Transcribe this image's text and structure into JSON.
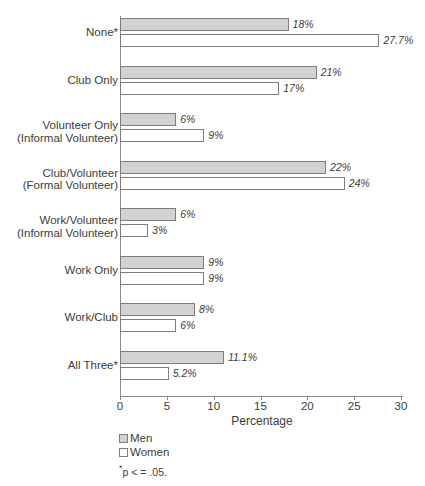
{
  "chart_data": {
    "type": "bar",
    "orientation": "horizontal",
    "title": "",
    "xlabel": "Percentage",
    "ylabel": "",
    "xlim": [
      0,
      30
    ],
    "xticks": [
      0,
      5,
      10,
      15,
      20,
      25,
      30
    ],
    "xticklabels": [
      "0",
      "5",
      "10",
      "15",
      "20",
      "25",
      "30"
    ],
    "grid": false,
    "legend_position": "below-axis-left",
    "categories": [
      {
        "line1": "None*",
        "line2": ""
      },
      {
        "line1": "Club Only",
        "line2": ""
      },
      {
        "line1": "Volunteer Only",
        "line2": "(Informal Volunteer)"
      },
      {
        "line1": "Club/Volunteer",
        "line2": "(Formal Volunteer)"
      },
      {
        "line1": "Work/Volunteer",
        "line2": "(Informal Volunteer)"
      },
      {
        "line1": "Work Only",
        "line2": ""
      },
      {
        "line1": "Work/Club",
        "line2": ""
      },
      {
        "line1": "All Three*",
        "line2": ""
      }
    ],
    "series": [
      {
        "name": "Men",
        "color": "#d2d2d2",
        "values": [
          18,
          21,
          6,
          22,
          6,
          9,
          8,
          11.1
        ],
        "labels": [
          "18%",
          "21%",
          "6%",
          "22%",
          "6%",
          "9%",
          "8%",
          "11.1%"
        ]
      },
      {
        "name": "Women",
        "color": "#ffffff",
        "values": [
          27.7,
          17,
          9,
          24,
          3,
          9,
          6,
          5.2
        ],
        "labels": [
          "27.7%",
          "17%",
          "9%",
          "24%",
          "3%",
          "9%",
          "6%",
          "5.2%"
        ]
      }
    ],
    "annotations": [
      "*p < = .05."
    ]
  },
  "legend": {
    "items": [
      {
        "label": "Men",
        "swatch": "men"
      },
      {
        "label": "Women",
        "swatch": "women"
      }
    ]
  },
  "footnote": {
    "star": "*",
    "text": "p < =  .05."
  }
}
